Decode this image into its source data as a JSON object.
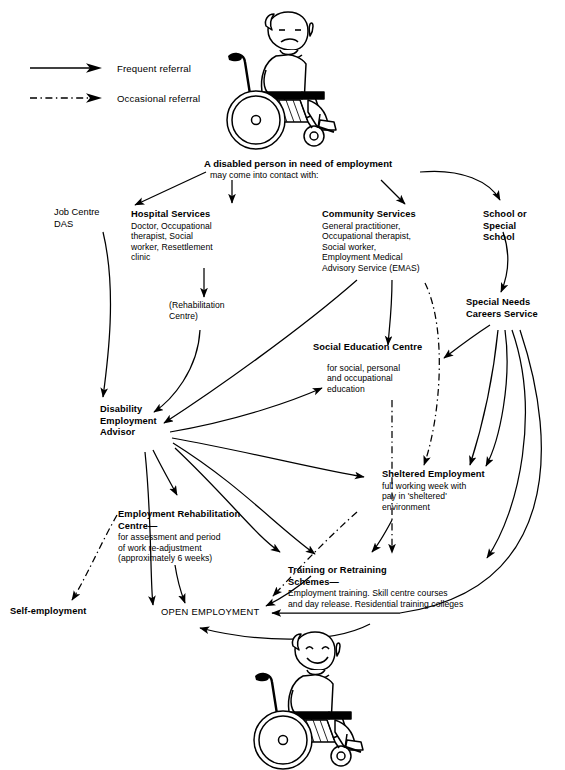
{
  "legend": {
    "items": [
      {
        "id": "frequent",
        "label": "Frequent referral",
        "style": "solid"
      },
      {
        "id": "occasional",
        "label": "Occasional referral",
        "style": "dash-dot"
      }
    ]
  },
  "figures": [
    {
      "id": "figure-top",
      "name": "person-in-wheelchair-unhappy",
      "mood": "unhappy"
    },
    {
      "id": "figure-bottom",
      "name": "person-in-wheelchair-smiling",
      "mood": "smiling"
    }
  ],
  "header": {
    "line1": "A disabled person in need of employment",
    "line2": "may come into contact with:"
  },
  "nodes": [
    {
      "id": "job-centre",
      "title": "Job Centre",
      "title2": "DAS",
      "lines": []
    },
    {
      "id": "hospital-services",
      "title": "Hospital Services",
      "lines": [
        "Doctor, Occupational",
        "therapist, Social",
        "worker, Resettlement",
        "clinic"
      ]
    },
    {
      "id": "rehabilitation-centre",
      "lines": [
        "(Rehabilitation",
        "Centre)"
      ]
    },
    {
      "id": "community-services",
      "title": "Community Services",
      "lines": [
        "General practitioner,",
        "Occupational therapist,",
        "Social worker,",
        "Employment Medical",
        "Advisory Service (EMAS)"
      ]
    },
    {
      "id": "school-or-special-school",
      "title": "School or",
      "title2": "Special",
      "title3": "School"
    },
    {
      "id": "special-needs-careers-service",
      "title": "Special Needs",
      "title2": "Careers Service"
    },
    {
      "id": "social-education-centre",
      "title": "Social Education Centre",
      "lines": [
        "for social, personal",
        "and occupational",
        "education"
      ]
    },
    {
      "id": "disability-employment-advisor",
      "title": "Disability",
      "title2": "Employment",
      "title3": "Advisor"
    },
    {
      "id": "sheltered-employment",
      "title": "Sheltered Employment",
      "lines": [
        "full working week with",
        "pay in 'sheltered'",
        "environment"
      ]
    },
    {
      "id": "employment-rehabilitation-centre",
      "title": "Employment Rehabilitation",
      "title2": "Centre—",
      "lines": [
        "for assessment and period",
        "of work re-adjustment",
        "(approximately 6 weeks)"
      ]
    },
    {
      "id": "training-or-retraining-schemes",
      "title": "Training or Retraining",
      "title2": "Schemes—",
      "lines": [
        "Employment training. Skill centre courses",
        "and day release. Residential training colleges"
      ]
    },
    {
      "id": "self-employment",
      "title": "Self-employment"
    },
    {
      "id": "open-employment",
      "title": "OPEN EMPLOYMENT"
    }
  ],
  "colors": {
    "ink": "#000000",
    "paper": "#ffffff"
  }
}
